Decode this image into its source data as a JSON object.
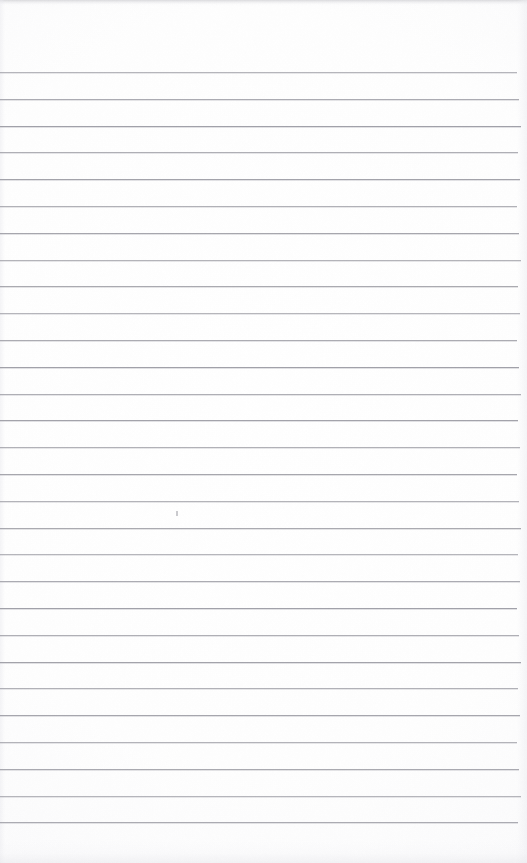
{
  "document": {
    "kind": "ruled-paper-scan",
    "title": "Blank Ruled Notebook Page",
    "description": "Scanned blank sheet of lined / ruled writing paper with no written content",
    "page_width": 527,
    "page_height": 863,
    "background_color": "#ffffff",
    "paper_tint": "#fdfdfe",
    "content_text": ""
  },
  "ruling": {
    "line_color": "#9a9aa2",
    "line_thickness_px": 1,
    "line_count": 29,
    "first_line_y": 72,
    "line_spacing_px": 26.8,
    "line_left_x": 0,
    "line_right_x": 519,
    "top_margin_px": 72,
    "bottom_margin_px": 41,
    "lines_y": [
      72,
      98.8,
      125.6,
      152.4,
      179.2,
      206,
      232.8,
      259.6,
      286.4,
      313.2,
      340,
      366.8,
      393.6,
      420.4,
      447.2,
      474,
      500.8,
      527.6,
      554.4,
      581.2,
      608,
      634.8,
      661.6,
      688.4,
      715.2,
      742,
      768.8,
      795.6,
      822.4
    ]
  },
  "marks": [
    {
      "name": "pencil-speck",
      "x": 176,
      "y": 511,
      "width": 2,
      "height": 5,
      "color": "#b8b8be"
    }
  ],
  "scan_artifacts": {
    "top_band_color": "#bebec3",
    "bottom_band_color": "#e8e8ec",
    "edge_shadow_color": "#ececf0"
  }
}
